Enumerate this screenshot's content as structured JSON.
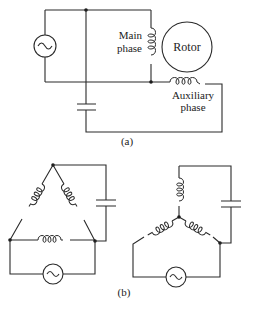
{
  "figure": {
    "part_a": {
      "caption": "(a)",
      "labels": {
        "main_phase_line1": "Main",
        "main_phase_line2": "phase",
        "rotor": "Rotor",
        "auxiliary_line1": "Auxiliary",
        "auxiliary_line2": "phase"
      },
      "components": [
        "ac-source",
        "main-phase-winding",
        "rotor",
        "auxiliary-phase-winding",
        "capacitor"
      ]
    },
    "part_b": {
      "caption": "(b)",
      "left_circuit": {
        "topology": "delta",
        "components": [
          "ac-source",
          "winding",
          "winding",
          "winding",
          "capacitor"
        ]
      },
      "right_circuit": {
        "topology": "wye",
        "components": [
          "ac-source",
          "winding",
          "winding",
          "winding",
          "capacitor"
        ]
      }
    },
    "colors": {
      "ink": "#2a2a2a",
      "background": "#ffffff"
    }
  }
}
